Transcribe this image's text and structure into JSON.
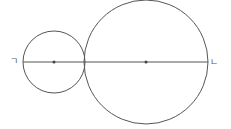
{
  "diagram": {
    "type": "geometry",
    "stroke_color": "#555555",
    "small_circle": {
      "cx": 54,
      "cy": 62,
      "r": 31
    },
    "large_circle": {
      "cx": 146,
      "cy": 62,
      "r": 62
    },
    "line": {
      "x1": 23,
      "y1": 62,
      "x2": 208,
      "y2": 62
    },
    "labels": {
      "left": "ㄱ",
      "right": "ㄴ"
    }
  }
}
